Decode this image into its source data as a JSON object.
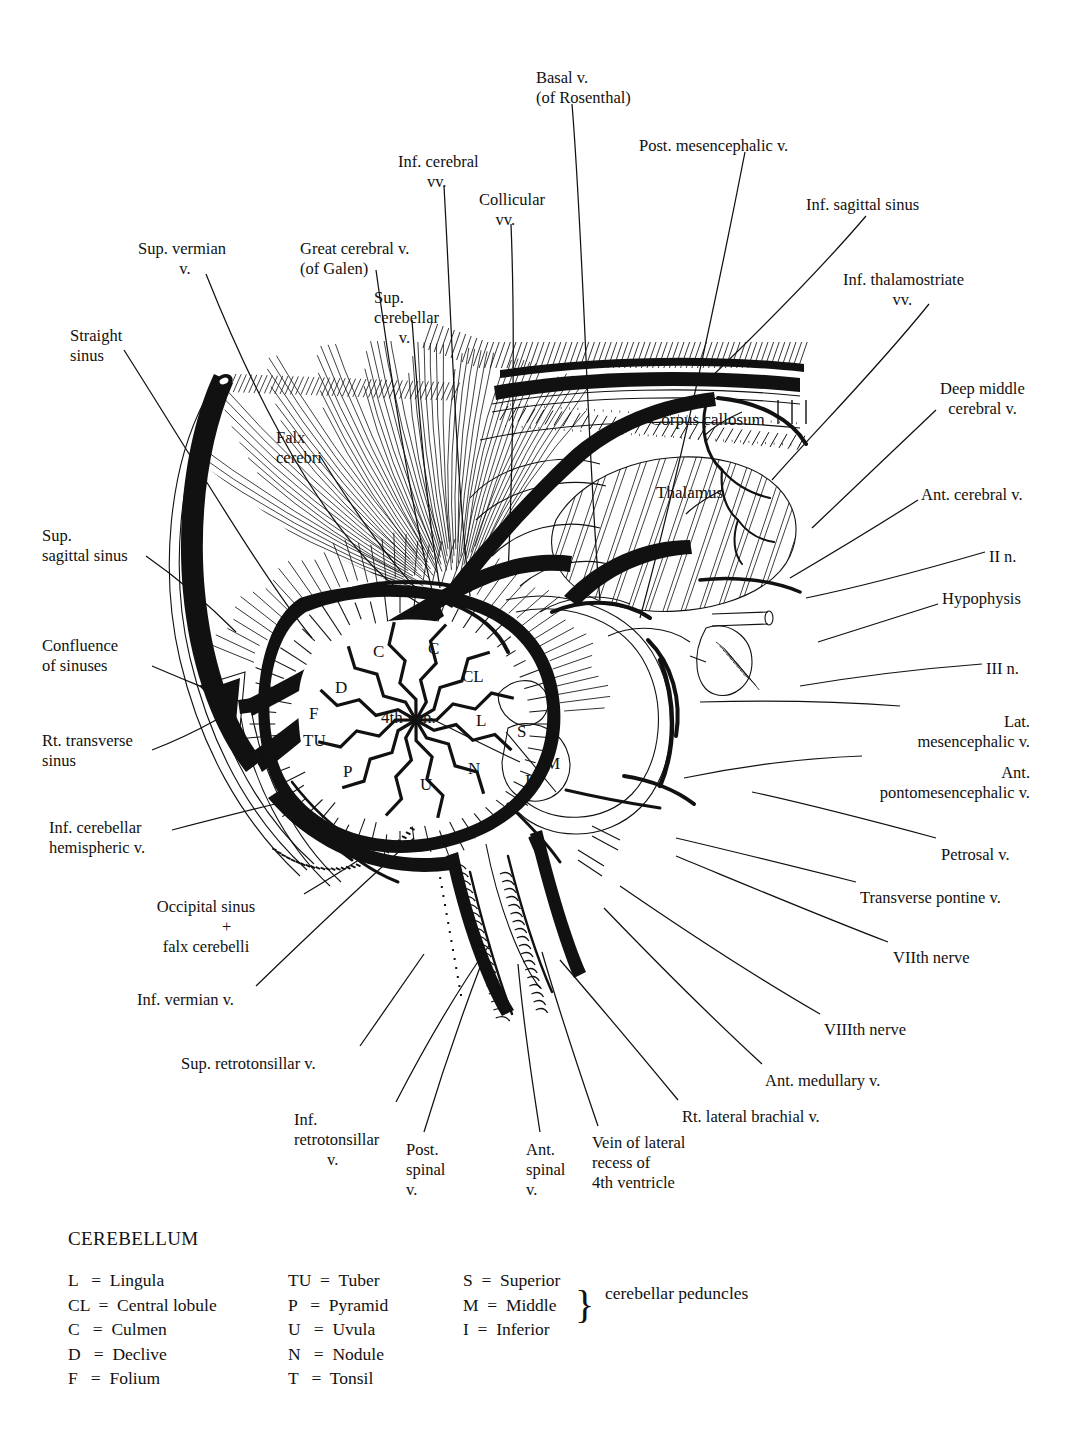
{
  "figure": {
    "kind": "anatomical-illustration"
  },
  "callouts": [
    {
      "id": "basal-v",
      "text": "Basal v.\n(of Rosenthal)",
      "x": 536,
      "y": 68,
      "align": "left"
    },
    {
      "id": "post-mesencephalic-v",
      "text": "Post. mesencephalic v.",
      "x": 639,
      "y": 136,
      "align": "left"
    },
    {
      "id": "inf-cerebral-vv",
      "text": "Inf. cerebral\n       vv.",
      "x": 398,
      "y": 152,
      "align": "left"
    },
    {
      "id": "collicular-vv",
      "text": "Collicular\n    vv.",
      "x": 479,
      "y": 190,
      "align": "left"
    },
    {
      "id": "inf-sagittal-sinus",
      "text": "Inf. sagittal sinus",
      "x": 806,
      "y": 195,
      "align": "left"
    },
    {
      "id": "sup-vermian-v",
      "text": "Sup. vermian\n          v.",
      "x": 138,
      "y": 239,
      "align": "left"
    },
    {
      "id": "great-cerebral-v",
      "text": "Great cerebral v.\n(of Galen)",
      "x": 300,
      "y": 239,
      "align": "left"
    },
    {
      "id": "inf-thalamostriate-vv",
      "text": "Inf. thalamostriate\n            vv.",
      "x": 843,
      "y": 270,
      "align": "left"
    },
    {
      "id": "sup-cerebellar-v",
      "text": "Sup.\ncerebellar\n      v.",
      "x": 374,
      "y": 288,
      "align": "left"
    },
    {
      "id": "straight-sinus",
      "text": "Straight\nsinus",
      "x": 70,
      "y": 326,
      "align": "left"
    },
    {
      "id": "deep-middle-cerebral-v",
      "text": "Deep middle\n  cerebral v.",
      "x": 940,
      "y": 379,
      "align": "left"
    },
    {
      "id": "falx-cerebri",
      "text": "Falx\ncerebri",
      "x": 276,
      "y": 428,
      "align": "left"
    },
    {
      "id": "ant-cerebral-v",
      "text": "Ant. cerebral v.",
      "x": 921,
      "y": 485,
      "align": "left"
    },
    {
      "id": "sup-sagittal-sinus",
      "text": "Sup.\nsagittal sinus",
      "x": 42,
      "y": 526,
      "align": "left"
    },
    {
      "id": "ii-n",
      "text": "II n.",
      "x": 989,
      "y": 547,
      "align": "left"
    },
    {
      "id": "hypophysis",
      "text": "Hypophysis",
      "x": 942,
      "y": 589,
      "align": "left"
    },
    {
      "id": "confluence-of-sinuses",
      "text": "Confluence\nof sinuses",
      "x": 42,
      "y": 636,
      "align": "left"
    },
    {
      "id": "iii-n",
      "text": "III n.",
      "x": 986,
      "y": 659,
      "align": "left"
    },
    {
      "id": "lat-mesencephalic-v",
      "text": "Lat.\nmesencephalic v.",
      "x": 900,
      "y": 712,
      "align": "right"
    },
    {
      "id": "rt-transverse-sinus",
      "text": "Rt. transverse\nsinus",
      "x": 42,
      "y": 731,
      "align": "left"
    },
    {
      "id": "ant-pontomesencephalic-v",
      "text": "Ant.\npontomesencephalic v.",
      "x": 860,
      "y": 763,
      "align": "right"
    },
    {
      "id": "inf-cerebellar-hemispheric-v",
      "text": "Inf. cerebellar\nhemispheric v.",
      "x": 49,
      "y": 818,
      "align": "left"
    },
    {
      "id": "petrosal-v",
      "text": "Petrosal v.",
      "x": 941,
      "y": 845,
      "align": "left"
    },
    {
      "id": "transverse-pontine-v",
      "text": "Transverse pontine v.",
      "x": 860,
      "y": 888,
      "align": "left"
    },
    {
      "id": "occipital-sinus-falx-cerebelli",
      "text": "Occipital sinus\n          +\nfalx cerebelli",
      "x": 106,
      "y": 897,
      "align": "left"
    },
    {
      "id": "viith-nerve",
      "text": "VIIth nerve",
      "x": 893,
      "y": 948,
      "align": "left"
    },
    {
      "id": "inf-vermian-v",
      "text": "Inf. vermian v.",
      "x": 137,
      "y": 990,
      "align": "left"
    },
    {
      "id": "viiith-nerve",
      "text": "VIIIth nerve",
      "x": 824,
      "y": 1020,
      "align": "left"
    },
    {
      "id": "sup-retrotonsillar-v",
      "text": "Sup. retrotonsillar v.",
      "x": 181,
      "y": 1054,
      "align": "left"
    },
    {
      "id": "ant-medullary-v",
      "text": "Ant. medullary v.",
      "x": 765,
      "y": 1071,
      "align": "left"
    },
    {
      "id": "rt-lateral-brachial-v",
      "text": "Rt. lateral brachial v.",
      "x": 682,
      "y": 1107,
      "align": "left"
    },
    {
      "id": "inf-retrotonsillar-v",
      "text": "Inf.\nretrotonsillar\n        v.",
      "x": 294,
      "y": 1110,
      "align": "left"
    },
    {
      "id": "vein-of-lateral-recess",
      "text": "Vein of lateral\nrecess of\n4th ventricle",
      "x": 592,
      "y": 1133,
      "align": "left"
    },
    {
      "id": "ant-spinal-v",
      "text": "Ant.\nspinal\nv.",
      "x": 526,
      "y": 1140,
      "align": "left"
    },
    {
      "id": "post-spinal-v",
      "text": "Post.\nspinal\nv.",
      "x": 406,
      "y": 1140,
      "align": "left"
    }
  ],
  "interior_labels": [
    {
      "id": "corpus-callosum",
      "text": "Corpus callosum",
      "x": 650,
      "y": 411
    },
    {
      "id": "thalamus",
      "text": "Thalamus",
      "x": 656,
      "y": 484
    },
    {
      "id": "fourth-ventricle",
      "text": "4th ven.",
      "x": 381,
      "y": 709
    },
    {
      "id": "culmen-left",
      "text": "C",
      "x": 373,
      "y": 643
    },
    {
      "id": "culmen-right",
      "text": "C",
      "x": 428,
      "y": 640
    },
    {
      "id": "central-lobule",
      "text": "CL",
      "x": 462,
      "y": 668
    },
    {
      "id": "declive",
      "text": "D",
      "x": 335,
      "y": 679
    },
    {
      "id": "folium",
      "text": "F",
      "x": 309,
      "y": 705
    },
    {
      "id": "tuber",
      "text": "TU",
      "x": 303,
      "y": 732
    },
    {
      "id": "pyramid",
      "text": "P",
      "x": 343,
      "y": 763
    },
    {
      "id": "uvula",
      "text": "U",
      "x": 420,
      "y": 776
    },
    {
      "id": "nodule",
      "text": "N",
      "x": 468,
      "y": 760
    },
    {
      "id": "lingula",
      "text": "L",
      "x": 476,
      "y": 712
    },
    {
      "id": "peduncle-superior",
      "text": "S",
      "x": 517,
      "y": 723
    },
    {
      "id": "peduncle-middle",
      "text": "M",
      "x": 545,
      "y": 755
    },
    {
      "id": "peduncle-inferior",
      "text": "I",
      "x": 525,
      "y": 772
    }
  ],
  "legend": {
    "title": "CEREBELLUM",
    "columns": [
      {
        "id": "col-lobules-1",
        "rows": [
          "L   =  Lingula",
          "CL  =  Central lobule",
          "C   =  Culmen",
          "D   =  Declive",
          "F   =  Folium"
        ]
      },
      {
        "id": "col-lobules-2",
        "rows": [
          "TU  =  Tuber",
          "P   =  Pyramid",
          "U   =  Uvula",
          "N   =  Nodule",
          "T   =  Tonsil"
        ]
      },
      {
        "id": "col-peduncles",
        "rows": [
          "S  =  Superior",
          "M  =  Middle",
          "I  =  Inferior"
        ]
      }
    ],
    "brace": "}",
    "brace_caption": "cerebellar\npeduncles"
  },
  "colors": {
    "ink": "#111111",
    "paper": "#ffffff"
  }
}
